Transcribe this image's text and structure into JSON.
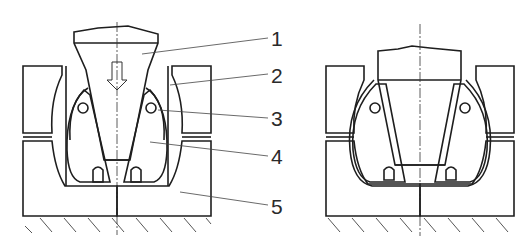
{
  "figure": {
    "title": "",
    "views": [
      {
        "name": "left-view",
        "state": "punch descending (open)",
        "direction_arrow": "down-arrow-icon"
      },
      {
        "name": "right-view",
        "state": "punch pressed (closed)"
      }
    ],
    "callouts": [
      {
        "label": "1"
      },
      {
        "label": "2"
      },
      {
        "label": "3"
      },
      {
        "label": "4"
      },
      {
        "label": "5"
      }
    ]
  }
}
